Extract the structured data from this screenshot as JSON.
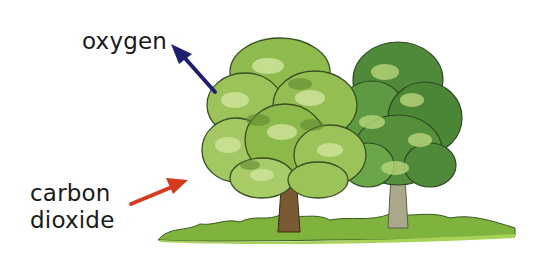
{
  "diagram": {
    "labels": {
      "oxygen": "oxygen",
      "carbon_dioxide_line1": "carbon",
      "carbon_dioxide_line2": "dioxide"
    },
    "arrows": [
      {
        "name": "oxygen-arrow",
        "direction": "out-of-tree, up-left",
        "color": "#1f1f6e"
      },
      {
        "name": "carbon-dioxide-arrow",
        "direction": "into-tree, up-right",
        "color": "#d63a1e"
      }
    ],
    "elements": [
      "light-green deciduous tree",
      "dark-green deciduous tree",
      "grass strip"
    ],
    "colors": {
      "light_foliage": "#9cc25a",
      "dark_foliage": "#4f8a3a",
      "trunk_brown": "#7a5a33",
      "trunk_grey": "#a9a88a",
      "grass": "#7fb33d"
    }
  }
}
